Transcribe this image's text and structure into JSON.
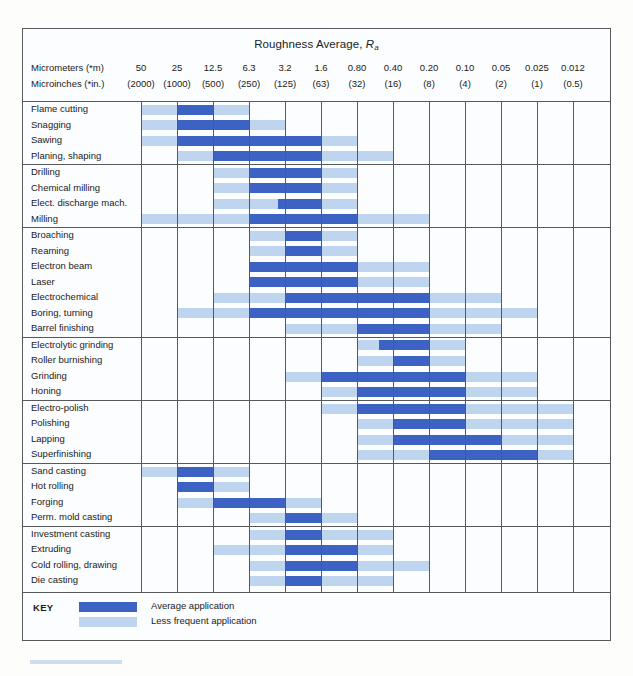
{
  "chart_data": {
    "type": "bar",
    "title": "Roughness Average, Ra",
    "title_main": "Roughness Average, ",
    "title_italic": "R",
    "title_sub": "a",
    "xlabel": "",
    "ylabel": "",
    "grid": true,
    "legend_position": "bottom-left",
    "axis": {
      "unit_row_1_label": "Micrometers (*m)",
      "unit_row_2_label": "Microinches (*in.)",
      "micrometers": [
        "50",
        "25",
        "12.5",
        "6.3",
        "3.2",
        "1.6",
        "0.80",
        "0.40",
        "0.20",
        "0.10",
        "0.05",
        "0.025",
        "0.012"
      ],
      "microinches": [
        "(2000)",
        "(1000)",
        "(500)",
        "(250)",
        "(125)",
        "(63)",
        "(32)",
        "(16)",
        "(8)",
        "(4)",
        "(2)",
        "(1)",
        "(0.5)"
      ]
    },
    "legend": [
      {
        "key": "dark",
        "label": "Average application",
        "color": "#3c63c3"
      },
      {
        "key": "light",
        "label": "Less frequent application",
        "color": "#bfd4ef"
      }
    ],
    "key_title": "KEY",
    "colors": {
      "average": "#3c63c3",
      "less_frequent": "#bfd4ef",
      "border": "#58595b",
      "background": "#fcfdfe"
    },
    "groups": [
      {
        "name": "group-1",
        "rows": [
          {
            "label": "Flame cutting",
            "light": [
              0,
              3
            ],
            "dark": [
              1,
              2
            ]
          },
          {
            "label": "Snagging",
            "light": [
              0,
              4
            ],
            "dark": [
              1,
              3
            ]
          },
          {
            "label": "Sawing",
            "light": [
              0,
              6
            ],
            "dark": [
              1,
              5
            ]
          },
          {
            "label": "Planing, shaping",
            "light": [
              1,
              7
            ],
            "dark": [
              2,
              5
            ]
          }
        ]
      },
      {
        "name": "group-2",
        "rows": [
          {
            "label": "Drilling",
            "light": [
              2,
              6
            ],
            "dark": [
              3,
              5
            ]
          },
          {
            "label": "Chemical milling",
            "light": [
              2,
              6
            ],
            "dark": [
              3,
              5
            ]
          },
          {
            "label": "Elect. discharge mach.",
            "light": [
              2,
              6
            ],
            "dark": [
              3.8,
              5
            ]
          },
          {
            "label": "Milling",
            "light": [
              0,
              8
            ],
            "dark": [
              3,
              6
            ]
          }
        ]
      },
      {
        "name": "group-3",
        "rows": [
          {
            "label": "Broaching",
            "light": [
              3,
              6
            ],
            "dark": [
              4,
              5
            ]
          },
          {
            "label": "Reaming",
            "light": [
              3,
              6
            ],
            "dark": [
              4,
              5
            ]
          },
          {
            "label": "Electron beam",
            "light": [
              3,
              8
            ],
            "dark": [
              3,
              6
            ]
          },
          {
            "label": "Laser",
            "light": [
              3,
              8
            ],
            "dark": [
              3,
              6
            ]
          },
          {
            "label": "Electrochemical",
            "light": [
              2,
              10
            ],
            "dark": [
              4,
              8
            ]
          },
          {
            "label": "Boring, turning",
            "light": [
              1,
              11
            ],
            "dark": [
              3,
              8
            ],
            "dark2": [
              5,
              7
            ]
          },
          {
            "label": "Barrel finishing",
            "light": [
              4,
              10
            ],
            "dark": [
              6,
              8
            ]
          }
        ]
      },
      {
        "name": "group-4",
        "rows": [
          {
            "label": "Electrolytic grinding",
            "light": [
              6,
              9
            ],
            "dark": [
              6.6,
              8
            ]
          },
          {
            "label": "Roller burnishing",
            "light": [
              6,
              9
            ],
            "dark": [
              7,
              8
            ]
          },
          {
            "label": "Grinding",
            "light": [
              4,
              11
            ],
            "dark": [
              5,
              9
            ]
          },
          {
            "label": "Honing",
            "light": [
              5,
              11
            ],
            "dark": [
              6,
              9
            ]
          }
        ]
      },
      {
        "name": "group-5",
        "rows": [
          {
            "label": "Electro-polish",
            "light": [
              5,
              12
            ],
            "dark": [
              6,
              9
            ]
          },
          {
            "label": "Polishing",
            "light": [
              6,
              12
            ],
            "dark": [
              7,
              9
            ]
          },
          {
            "label": "Lapping",
            "light": [
              6,
              12
            ],
            "dark": [
              7,
              10
            ]
          },
          {
            "label": "Superfinishing",
            "light": [
              6,
              12
            ],
            "dark": [
              8,
              11
            ]
          }
        ]
      },
      {
        "name": "group-6",
        "rows": [
          {
            "label": "Sand casting",
            "light": [
              0,
              3
            ],
            "dark": [
              1,
              2
            ]
          },
          {
            "label": "Hot rolling",
            "light": [
              1,
              3
            ],
            "dark": [
              1,
              2
            ]
          },
          {
            "label": "Forging",
            "light": [
              1,
              5
            ],
            "dark": [
              2,
              4
            ]
          },
          {
            "label": "Perm. mold casting",
            "light": [
              3,
              6
            ],
            "dark": [
              4,
              5
            ]
          }
        ]
      },
      {
        "name": "group-7",
        "rows": [
          {
            "label": "Investment casting",
            "light": [
              3,
              7
            ],
            "dark": [
              4,
              5
            ]
          },
          {
            "label": "Extruding",
            "light": [
              2,
              7
            ],
            "dark": [
              4,
              6
            ]
          },
          {
            "label": "Cold rolling, drawing",
            "light": [
              3,
              8
            ],
            "dark": [
              4,
              6
            ]
          },
          {
            "label": "Die casting",
            "light": [
              3,
              7
            ],
            "dark": [
              4,
              5
            ]
          }
        ]
      }
    ]
  }
}
